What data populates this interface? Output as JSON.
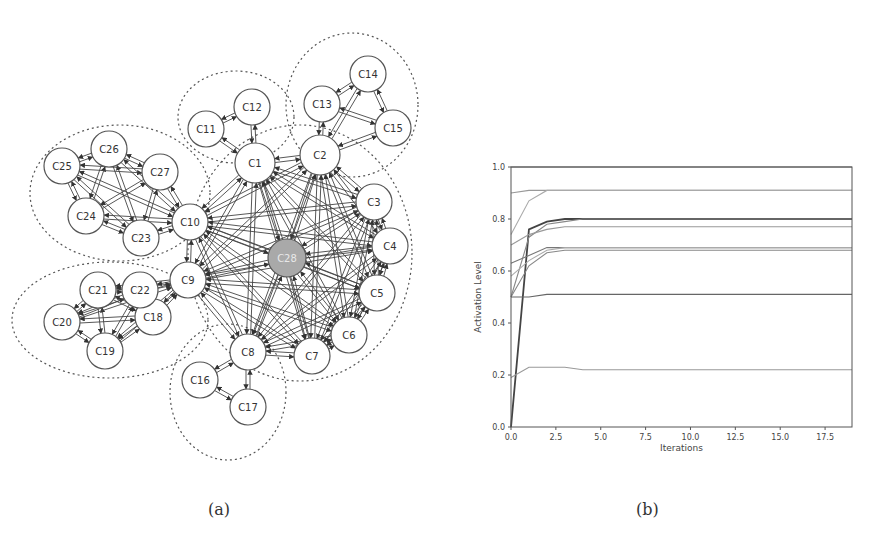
{
  "captions": {
    "a": "(a)",
    "b": "(b)"
  },
  "diagram": {
    "highlight_node": "C28",
    "nodes": [
      {
        "id": "C1",
        "x": 255,
        "y": 163,
        "r": 20
      },
      {
        "id": "C2",
        "x": 320,
        "y": 155,
        "r": 20
      },
      {
        "id": "C3",
        "x": 374,
        "y": 202,
        "r": 18
      },
      {
        "id": "C4",
        "x": 390,
        "y": 246,
        "r": 18
      },
      {
        "id": "C5",
        "x": 377,
        "y": 293,
        "r": 18
      },
      {
        "id": "C6",
        "x": 349,
        "y": 335,
        "r": 18
      },
      {
        "id": "C7",
        "x": 312,
        "y": 356,
        "r": 18
      },
      {
        "id": "C8",
        "x": 248,
        "y": 352,
        "r": 18
      },
      {
        "id": "C9",
        "x": 188,
        "y": 280,
        "r": 18
      },
      {
        "id": "C10",
        "x": 190,
        "y": 222,
        "r": 18
      },
      {
        "id": "C11",
        "x": 206,
        "y": 129,
        "r": 18
      },
      {
        "id": "C12",
        "x": 252,
        "y": 107,
        "r": 18
      },
      {
        "id": "C13",
        "x": 322,
        "y": 104,
        "r": 18
      },
      {
        "id": "C14",
        "x": 368,
        "y": 74,
        "r": 18
      },
      {
        "id": "C15",
        "x": 393,
        "y": 128,
        "r": 18
      },
      {
        "id": "C16",
        "x": 200,
        "y": 380,
        "r": 18
      },
      {
        "id": "C17",
        "x": 248,
        "y": 407,
        "r": 18
      },
      {
        "id": "C18",
        "x": 153,
        "y": 317,
        "r": 18
      },
      {
        "id": "C19",
        "x": 105,
        "y": 351,
        "r": 18
      },
      {
        "id": "C20",
        "x": 62,
        "y": 322,
        "r": 18
      },
      {
        "id": "C21",
        "x": 98,
        "y": 290,
        "r": 18
      },
      {
        "id": "C22",
        "x": 140,
        "y": 290,
        "r": 18
      },
      {
        "id": "C23",
        "x": 141,
        "y": 238,
        "r": 18
      },
      {
        "id": "C24",
        "x": 86,
        "y": 216,
        "r": 18
      },
      {
        "id": "C25",
        "x": 62,
        "y": 166,
        "r": 18
      },
      {
        "id": "C26",
        "x": 109,
        "y": 149,
        "r": 18
      },
      {
        "id": "C27",
        "x": 160,
        "y": 172,
        "r": 18
      },
      {
        "id": "C28",
        "x": 287,
        "y": 258,
        "r": 19
      }
    ],
    "clusters": [
      {
        "name": "cluster-c11-c12",
        "cx": 236,
        "cy": 117,
        "rx": 58,
        "ry": 46
      },
      {
        "name": "cluster-c13-c15",
        "cx": 352,
        "cy": 105,
        "rx": 66,
        "ry": 72
      },
      {
        "name": "cluster-c23-c27",
        "cx": 120,
        "cy": 193,
        "rx": 90,
        "ry": 68
      },
      {
        "name": "cluster-c18-c22",
        "cx": 110,
        "cy": 320,
        "rx": 98,
        "ry": 58
      },
      {
        "name": "cluster-c16-c17",
        "cx": 228,
        "cy": 392,
        "rx": 58,
        "ry": 68
      },
      {
        "name": "cluster-core",
        "cx": 300,
        "cy": 253,
        "rx": 112,
        "ry": 128
      }
    ]
  },
  "chart_data": {
    "type": "line",
    "title": "",
    "xlabel": "Iterations",
    "ylabel": "Activation Level",
    "xlim": [
      0,
      19
    ],
    "ylim": [
      0.0,
      1.0
    ],
    "xticks": [
      "0.0",
      "2.5",
      "5.0",
      "7.5",
      "10.0",
      "12.5",
      "15.0",
      "17.5"
    ],
    "yticks": [
      "0.0",
      "0.2",
      "0.4",
      "0.6",
      "0.8",
      "1.0"
    ],
    "grid": false,
    "legend": null,
    "x": [
      0,
      1,
      2,
      3,
      4,
      5,
      6,
      7,
      8,
      9,
      10,
      11,
      12,
      13,
      14,
      15,
      16,
      17,
      18,
      19
    ],
    "series": [
      {
        "name": "s1",
        "values": [
          1.0,
          1.0,
          1.0,
          1.0,
          1.0,
          1.0,
          1.0,
          1.0,
          1.0,
          1.0,
          1.0,
          1.0,
          1.0,
          1.0,
          1.0,
          1.0,
          1.0,
          1.0,
          1.0,
          1.0
        ]
      },
      {
        "name": "s2",
        "values": [
          0.9,
          0.91,
          0.91,
          0.91,
          0.91,
          0.91,
          0.91,
          0.91,
          0.91,
          0.91,
          0.91,
          0.91,
          0.91,
          0.91,
          0.91,
          0.91,
          0.91,
          0.91,
          0.91,
          0.91
        ]
      },
      {
        "name": "s3",
        "values": [
          0.74,
          0.87,
          0.91,
          0.91,
          0.91,
          0.91,
          0.91,
          0.91,
          0.91,
          0.91,
          0.91,
          0.91,
          0.91,
          0.91,
          0.91,
          0.91,
          0.91,
          0.91,
          0.91,
          0.91
        ]
      },
      {
        "name": "s4",
        "values": [
          0.0,
          0.76,
          0.79,
          0.8,
          0.8,
          0.8,
          0.8,
          0.8,
          0.8,
          0.8,
          0.8,
          0.8,
          0.8,
          0.8,
          0.8,
          0.8,
          0.8,
          0.8,
          0.8,
          0.8
        ]
      },
      {
        "name": "s5",
        "values": [
          0.5,
          0.73,
          0.78,
          0.79,
          0.8,
          0.8,
          0.8,
          0.8,
          0.8,
          0.8,
          0.8,
          0.8,
          0.8,
          0.8,
          0.8,
          0.8,
          0.8,
          0.8,
          0.8,
          0.8
        ]
      },
      {
        "name": "s6",
        "values": [
          0.7,
          0.74,
          0.76,
          0.77,
          0.77,
          0.77,
          0.77,
          0.77,
          0.77,
          0.77,
          0.77,
          0.77,
          0.77,
          0.77,
          0.77,
          0.77,
          0.77,
          0.77,
          0.77,
          0.77
        ]
      },
      {
        "name": "s7",
        "values": [
          0.63,
          0.66,
          0.69,
          0.69,
          0.69,
          0.69,
          0.69,
          0.69,
          0.69,
          0.69,
          0.69,
          0.69,
          0.69,
          0.69,
          0.69,
          0.69,
          0.69,
          0.69,
          0.69,
          0.69
        ]
      },
      {
        "name": "s8",
        "values": [
          0.58,
          0.64,
          0.68,
          0.69,
          0.69,
          0.69,
          0.69,
          0.69,
          0.69,
          0.69,
          0.69,
          0.69,
          0.69,
          0.69,
          0.69,
          0.69,
          0.69,
          0.69,
          0.69,
          0.69
        ]
      },
      {
        "name": "s9",
        "values": [
          0.5,
          0.62,
          0.67,
          0.68,
          0.68,
          0.68,
          0.68,
          0.68,
          0.68,
          0.68,
          0.68,
          0.68,
          0.68,
          0.68,
          0.68,
          0.68,
          0.68,
          0.68,
          0.68,
          0.68
        ]
      },
      {
        "name": "s10",
        "values": [
          0.5,
          0.5,
          0.51,
          0.51,
          0.51,
          0.51,
          0.51,
          0.51,
          0.51,
          0.51,
          0.51,
          0.51,
          0.51,
          0.51,
          0.51,
          0.51,
          0.51,
          0.51,
          0.51,
          0.51
        ]
      },
      {
        "name": "s11",
        "values": [
          0.19,
          0.23,
          0.23,
          0.23,
          0.22,
          0.22,
          0.22,
          0.22,
          0.22,
          0.22,
          0.22,
          0.22,
          0.22,
          0.22,
          0.22,
          0.22,
          0.22,
          0.22,
          0.22,
          0.22
        ]
      }
    ]
  }
}
